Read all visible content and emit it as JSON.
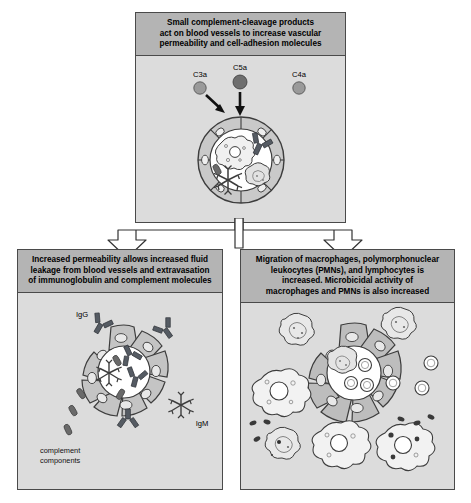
{
  "figure": {
    "title": "Small complement-cleavage products act on blood vessels to increase vascular permeability and cell-adhesion molecules",
    "background_color": "#ffffff"
  },
  "colors": {
    "panel_fill": "#dcdcdc",
    "panel_header_fill": "#b4b4b4",
    "panel_border": "#4a4a4a",
    "vessel_wall_light": "#c8c8c8",
    "vessel_wall_mid": "#a9a9a9",
    "vessel_lumen": "#ffffff",
    "antibody_dark": "#555b63",
    "c5a_dot": "#6e6e6e",
    "c3a_dot": "#9a9a9a",
    "c4a_dot": "#9a9a9a",
    "arrow_black": "#111111",
    "connector_stroke": "#333333",
    "connector_fill": "#ffffff"
  },
  "panels": {
    "top": {
      "name": "top-panel",
      "header_lines": [
        "Small complement-cleavage products",
        "act on blood vessels to increase vascular",
        "permeability and cell-adhesion molecules"
      ],
      "labels": {
        "c3a": "C3a",
        "c5a": "C5a",
        "c4a": "C4a"
      },
      "diagram_elements": [
        "blood-vessel-cross-section",
        "endothelial-cell-segments",
        "macrophage",
        "lymphocyte",
        "igg-antibody",
        "igm-antibody",
        "complement-component",
        "c3a-arrow",
        "c5a-arrow"
      ]
    },
    "left": {
      "name": "bottom-left-panel",
      "header_lines": [
        "Increased permeability allows increased fluid",
        "leakage from blood vessels and extravasation",
        "of immunoglobulin and complement molecules"
      ],
      "labels": {
        "igg": "IgG",
        "igm": "IgM",
        "complement_line1": "complement",
        "complement_line2": "components"
      },
      "diagram_elements": [
        "blood-vessel-cross-section-gapped",
        "endothelial-cell-segments",
        "igg-antibody",
        "igm-antibody",
        "complement-components"
      ]
    },
    "right": {
      "name": "bottom-right-panel",
      "header_lines": [
        "Migration of macrophages, polymorphonuclear",
        "leukocytes (PMNs), and lymphocytes is",
        "increased. Microbicidal activity of",
        "macrophages and PMNs is also increased"
      ],
      "labels": {},
      "diagram_elements": [
        "blood-vessel-cross-section-gapped",
        "endothelial-cell-segments",
        "macrophages",
        "pmn-leukocytes",
        "lymphocytes",
        "bacteria",
        "migrating-cell"
      ]
    }
  },
  "connector": {
    "name": "branching-arrow-connector",
    "description": "hollow outlined arrow splitting downward from top panel into two arrowheads"
  }
}
